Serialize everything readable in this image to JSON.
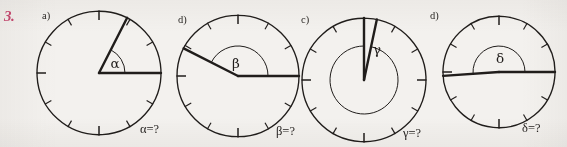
{
  "exercise": {
    "number": "3.",
    "number_color": "#c94a72"
  },
  "page": {
    "background_color": "#f3f1ee",
    "ink_color": "#201d1b",
    "width": 567,
    "height": 147
  },
  "figures": [
    {
      "part_label": "a)",
      "angle_symbol": "α",
      "answer_text": "α=?",
      "arc_label": "α",
      "center_x": 99,
      "center_y": 73,
      "radius": 62,
      "tick_count": 12,
      "ray_angles_deg": [
        0,
        63
      ],
      "angle_value_deg": 63,
      "arc_radius": 26
    },
    {
      "part_label": "d)",
      "angle_symbol": "β",
      "answer_text": "β=?",
      "arc_label": "β",
      "center_x": 238,
      "center_y": 76,
      "radius": 61,
      "tick_count": 12,
      "ray_angles_deg": [
        0,
        153
      ],
      "angle_value_deg": 153,
      "arc_radius": 30
    },
    {
      "part_label": "c)",
      "angle_symbol": "γ",
      "answer_text": "γ=?",
      "arc_label": "γ",
      "center_x": 364,
      "center_y": 80,
      "radius": 62,
      "tick_count": 12,
      "ray_angles_deg": [
        90,
        78
      ],
      "angle_value_deg": 12,
      "arc_radius": 34
    },
    {
      "part_label": "d)",
      "angle_symbol": "δ",
      "answer_text": "δ=?",
      "arc_label": "δ",
      "center_x": 499,
      "center_y": 72,
      "radius": 56,
      "tick_count": 12,
      "ray_angles_deg": [
        0,
        184
      ],
      "angle_value_deg": 184,
      "arc_radius": 26
    }
  ],
  "chart_data": {
    "type": "diagram",
    "items": [
      {
        "label": "a)",
        "symbol": "α",
        "question": "α=?",
        "approx_degrees": 63
      },
      {
        "label": "d)",
        "symbol": "β",
        "question": "β=?",
        "approx_degrees": 153
      },
      {
        "label": "c)",
        "symbol": "γ",
        "question": "γ=?",
        "approx_degrees": 12
      },
      {
        "label": "d)",
        "symbol": "δ",
        "question": "δ=?",
        "approx_degrees": 184
      }
    ]
  }
}
